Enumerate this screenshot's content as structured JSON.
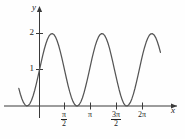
{
  "figure": {
    "background_color": "#fefefe",
    "curve_color": "#555555",
    "axis_color": "#3a3a3a"
  },
  "axes": {
    "x_axis_label": "x",
    "y_axis_label": "y",
    "x_ticks": [
      {
        "label_numerator": "π",
        "label_denominator": "2",
        "value": 1.5708,
        "display": "π/2",
        "is_fraction": true
      },
      {
        "label_numerator": "π",
        "label_denominator": "",
        "value": 3.1416,
        "display": "π",
        "is_fraction": false
      },
      {
        "label_numerator": "3π",
        "label_denominator": "2",
        "value": 4.7124,
        "display": "3π/2",
        "is_fraction": true
      },
      {
        "label_numerator": "2π",
        "label_denominator": "",
        "value": 6.2832,
        "display": "2π",
        "is_fraction": false
      }
    ],
    "y_ticks": [
      {
        "label": "1",
        "value": 1
      },
      {
        "label": "2",
        "value": 2
      }
    ]
  },
  "chart_data": {
    "type": "line",
    "title": "",
    "xlabel": "x",
    "ylabel": "y",
    "xlim": [
      -1.3,
      8.0
    ],
    "ylim": [
      -0.35,
      2.45
    ],
    "grid": false,
    "legend_position": "none",
    "series": [
      {
        "name": "y = 1 + sin(2x)",
        "equation": "y = 1 + sin(2x)",
        "amplitude": 1,
        "vertical_shift": 1,
        "period": 3.1416,
        "maximum_value": 2,
        "minimum_value": 0,
        "y_intercept": 1,
        "maxima_x": [
          0.7854,
          3.927,
          7.0686
        ],
        "minima_x": [
          -1.0472,
          2.356,
          5.4978
        ],
        "x": [
          -1.3,
          -1.2,
          -1.1,
          -1.0,
          -0.9,
          -0.8,
          -0.7,
          -0.6,
          -0.5,
          -0.4,
          -0.3,
          -0.2,
          -0.1,
          0.0,
          0.1,
          0.2,
          0.3,
          0.4,
          0.5,
          0.6,
          0.7,
          0.8,
          0.9,
          1.0,
          1.1,
          1.2,
          1.3,
          1.4,
          1.5,
          1.6,
          1.7,
          1.8,
          1.9,
          2.0,
          2.1,
          2.2,
          2.3,
          2.4,
          2.5,
          2.6,
          2.7,
          2.8,
          2.9,
          3.0,
          3.1,
          3.2,
          3.3,
          3.4,
          3.5,
          3.6,
          3.7,
          3.8,
          3.9,
          4.0,
          4.1,
          4.2,
          4.3,
          4.4,
          4.5,
          4.6,
          4.7,
          4.8,
          4.9,
          5.0,
          5.1,
          5.2,
          5.3,
          5.4,
          5.5,
          5.6,
          5.7,
          5.8,
          5.9,
          6.0,
          6.1,
          6.2,
          6.3,
          6.4,
          6.5,
          6.6,
          6.7,
          6.8,
          6.9,
          7.0,
          7.1,
          7.2,
          7.3,
          7.4,
          7.5,
          7.6
        ],
        "y": [
          0.485,
          0.325,
          0.192,
          0.091,
          0.027,
          0.001,
          0.015,
          0.068,
          0.159,
          0.283,
          0.435,
          0.611,
          0.801,
          1.0,
          1.199,
          1.389,
          1.565,
          1.717,
          1.841,
          1.932,
          1.985,
          1.999,
          1.974,
          1.909,
          1.808,
          1.675,
          1.516,
          1.335,
          1.141,
          0.942,
          0.745,
          0.558,
          0.388,
          0.243,
          0.128,
          0.047,
          0.005,
          0.003,
          0.041,
          0.116,
          0.228,
          0.37,
          0.537,
          0.721,
          0.916,
          1.116,
          1.311,
          1.492,
          1.657,
          1.794,
          1.898,
          1.967,
          1.999,
          1.99,
          1.942,
          1.857,
          1.739,
          1.59,
          1.412,
          1.223,
          1.026,
          0.829,
          0.636,
          0.456,
          0.296,
          0.163,
          0.063,
          0.009,
          0.001,
          0.029,
          0.093,
          0.195,
          0.329,
          0.49,
          0.672,
          0.868,
          1.068,
          1.264,
          1.45,
          1.615,
          1.757,
          1.871,
          1.95,
          1.991,
          1.995,
          1.96,
          1.888,
          1.781,
          1.642,
          1.479
        ]
      }
    ]
  },
  "annotations": {
    "origin_marker": "O"
  }
}
